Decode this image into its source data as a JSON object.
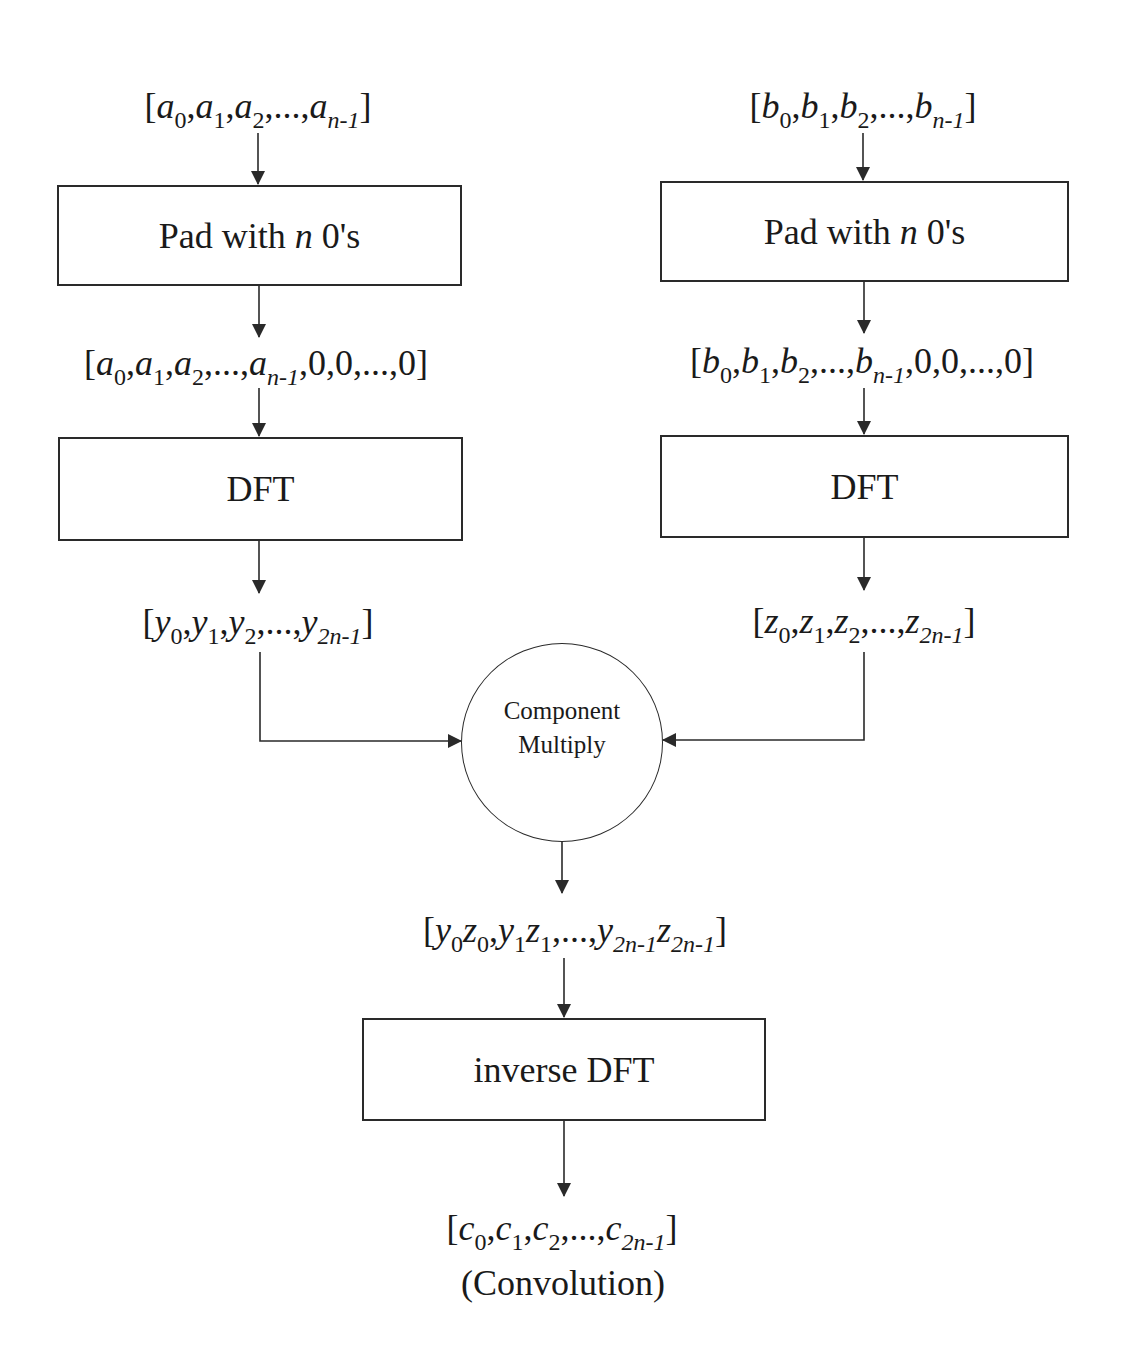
{
  "diagram": {
    "left_branch": {
      "input": {
        "symbol": "a",
        "terms": [
          "0",
          "1",
          "2"
        ],
        "ellipsis": "...",
        "last": "n-1"
      },
      "pad_box": {
        "prefix": "Pad with ",
        "var": "n",
        "suffix": " 0's"
      },
      "padded": {
        "symbol": "a",
        "terms": [
          "0",
          "1",
          "2"
        ],
        "ellipsis": "...",
        "last": "n-1",
        "zeros": ",0,0,...,0"
      },
      "dft_box": {
        "label": "DFT"
      },
      "transformed": {
        "symbol": "y",
        "terms": [
          "0",
          "1",
          "2"
        ],
        "ellipsis": "...",
        "last": "2n-1"
      }
    },
    "right_branch": {
      "input": {
        "symbol": "b",
        "terms": [
          "0",
          "1",
          "2"
        ],
        "ellipsis": "...",
        "last": "n-1"
      },
      "pad_box": {
        "prefix": "Pad with ",
        "var": "n",
        "suffix": " 0's"
      },
      "padded": {
        "symbol": "b",
        "terms": [
          "0",
          "1",
          "2"
        ],
        "ellipsis": "...",
        "last": "n-1",
        "zeros": ",0,0,...,0"
      },
      "dft_box": {
        "label": "DFT"
      },
      "transformed": {
        "symbol": "z",
        "terms": [
          "0",
          "1",
          "2"
        ],
        "ellipsis": "...",
        "last": "2n-1"
      }
    },
    "multiply_node": {
      "line1": "Component",
      "line2": "Multiply"
    },
    "product": {
      "y": "y",
      "z": "z",
      "terms": [
        "0",
        "1"
      ],
      "ellipsis": "...",
      "last": "2n-1"
    },
    "inverse_box": {
      "label": "inverse DFT"
    },
    "output": {
      "symbol": "c",
      "terms": [
        "0",
        "1",
        "2"
      ],
      "ellipsis": "...",
      "last": "2n-1"
    },
    "output_caption": "(Convolution)",
    "punct": {
      "open": "[",
      "close": "]",
      "comma": ","
    },
    "colors": {
      "stroke": "#2a2a2a",
      "text": "#1a1a1a",
      "background": "#ffffff"
    }
  }
}
